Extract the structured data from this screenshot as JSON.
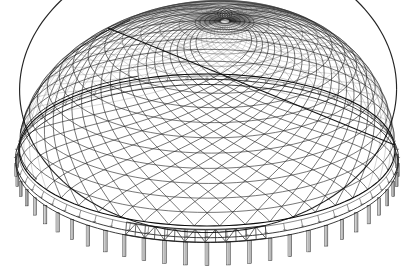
{
  "figure": {
    "drawing_style": "black-and-white technical line drawing / wireframe render",
    "background_color": "#ffffff",
    "line_color": "#1a1a1a",
    "column_fill_color": "#b9b9b9",
    "canvas": {
      "width": 414,
      "height": 280
    }
  },
  "geometry": {
    "projection": "oblique / perspective view from above-front",
    "dome_plan_shape": "ellipse",
    "plan_center": {
      "x": 207,
      "y": 150
    },
    "plan_semi_axis_x": 188,
    "plan_semi_axis_y": 76,
    "apex": {
      "x": 225,
      "y": 21
    },
    "dome_rise": 129,
    "rim_left": {
      "x": 19,
      "y": 170
    },
    "rim_right": {
      "x": 398,
      "y": 152
    },
    "rim_front_low": {
      "x": 215,
      "y": 248
    },
    "rim_back_high": {
      "x": 205,
      "y": 118
    }
  },
  "components": [
    {
      "name": "lattice-shell",
      "label": "Diagrid lattice shell",
      "count": 2,
      "description": "two counter-rotating families of spiral ribs forming diamond mesh"
    },
    {
      "name": "spiral-ribs-cw",
      "label": "Clockwise spiral ribs",
      "count": 46
    },
    {
      "name": "spiral-ribs-ccw",
      "label": "Counter-clockwise spiral ribs",
      "count": 46
    },
    {
      "name": "latitude-rings",
      "label": "Horizontal latitude rings",
      "count": 15
    },
    {
      "name": "compression-ring",
      "label": "Perimeter compression ring",
      "count": 1
    },
    {
      "name": "edge-truss",
      "label": "Zig-zag edge truss",
      "count": 1
    },
    {
      "name": "perimeter-columns",
      "label": "Perimeter support columns",
      "count": 56
    },
    {
      "name": "edge-hangers",
      "label": "Short edge hangers / fascia fins",
      "count": 60
    },
    {
      "name": "tie-member",
      "label": "Straight tie member across shell",
      "count": 1
    },
    {
      "name": "fold-seam",
      "label": "Left-side fold seam of far rim",
      "count": 1
    }
  ],
  "parameters": {
    "rib_count_per_family": 46,
    "latitude_ring_count": 15,
    "column_count": 56,
    "hanger_count": 60,
    "truss_bay_count": 7
  }
}
